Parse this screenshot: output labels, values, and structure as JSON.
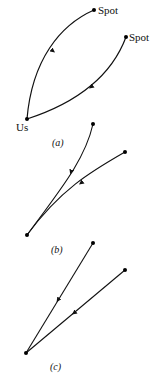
{
  "figure": {
    "panels": [
      {
        "id": "a",
        "caption": "(a)",
        "labels": {
          "origin": "Us",
          "spot1": "Spot",
          "spot2": "Spot"
        },
        "description": "Two curved paths from two Spot points converging at Us"
      },
      {
        "id": "b",
        "caption": "(b)",
        "description": "Two slightly curved paths converging at a common point"
      },
      {
        "id": "c",
        "caption": "(c)",
        "description": "Two straight lines converging at a common point"
      }
    ],
    "colors": {
      "stroke": "#111111",
      "background": "#ffffff"
    }
  }
}
